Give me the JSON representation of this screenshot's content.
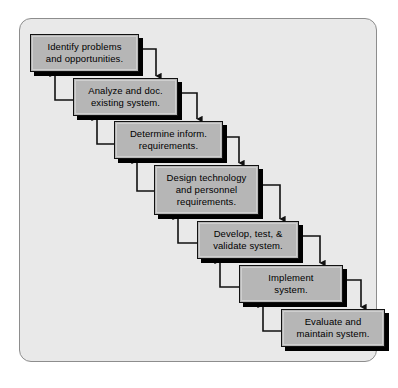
{
  "diagram": {
    "type": "waterfall-sdlc-flow",
    "frame": {
      "background_color": "#e9e9e9",
      "border_color": "#8d8d8d"
    },
    "box_style": {
      "fill_color": "#b6b6b6",
      "border_color": "#111111",
      "shadow_color": "#000000",
      "text_color": "#000000"
    },
    "stages": [
      {
        "id": "identify",
        "lines": [
          "Identify problems",
          "and opportunities."
        ],
        "x": 30,
        "y": 34,
        "width": 109,
        "height": 38
      },
      {
        "id": "analyze",
        "lines": [
          "Analyze and doc.",
          "existing system."
        ],
        "x": 73,
        "y": 78,
        "width": 105,
        "height": 38
      },
      {
        "id": "determine",
        "lines": [
          "Determine inform.",
          "requirements."
        ],
        "x": 114,
        "y": 121,
        "width": 109,
        "height": 38
      },
      {
        "id": "design",
        "lines": [
          "Design technology",
          "and personnel",
          "requirements."
        ],
        "x": 154,
        "y": 165,
        "width": 105,
        "height": 50
      },
      {
        "id": "develop",
        "lines": [
          "Develop, test, &",
          "validate system."
        ],
        "x": 197,
        "y": 221,
        "width": 102,
        "height": 38
      },
      {
        "id": "implement",
        "lines": [
          "Implement",
          "system."
        ],
        "x": 239,
        "y": 265,
        "width": 104,
        "height": 38
      },
      {
        "id": "evaluate",
        "lines": [
          "Evaluate and",
          "maintain system."
        ],
        "x": 281,
        "y": 309,
        "width": 104,
        "height": 38
      }
    ],
    "forward_arrows": [
      {
        "from": "identify",
        "to": "analyze",
        "path": "M 139 49 L 156 49 L 156 72 L 156 76",
        "label": "identify-to-analyze"
      },
      {
        "from": "analyze",
        "to": "determine",
        "path": "M 178 93 L 197 93 L 197 115 L 197 119",
        "label": "analyze-to-determine"
      },
      {
        "from": "determine",
        "to": "design",
        "path": "M 223 137 L 239 137 L 239 159 L 239 163",
        "label": "determine-to-design"
      },
      {
        "from": "design",
        "to": "develop",
        "path": "M 259 185 L 280 185 L 280 215 L 280 219",
        "label": "design-to-develop"
      },
      {
        "from": "develop",
        "to": "implement",
        "path": "M 299 236 L 320 236 L 320 259 L 320 263",
        "label": "develop-to-implement"
      },
      {
        "from": "implement",
        "to": "evaluate",
        "path": "M 343 280 L 361 280 L 361 303 L 361 307",
        "label": "implement-to-evaluate"
      }
    ],
    "feedback_arrows": [
      {
        "from": "analyze",
        "to": "identify",
        "path": "M 73 100 L 55 100 L 55 78 L 55 74",
        "label": "analyze-to-identify"
      },
      {
        "from": "determine",
        "to": "analyze",
        "path": "M 114 144 L 97 144 L 97 122 L 97 118",
        "label": "determine-to-analyze"
      },
      {
        "from": "design",
        "to": "determine",
        "path": "M 154 191 L 137 191 L 137 165 L 137 161",
        "label": "design-to-determine"
      },
      {
        "from": "develop",
        "to": "design",
        "path": "M 197 243 L 178 243 L 178 221 L 178 217",
        "label": "develop-to-design"
      },
      {
        "from": "implement",
        "to": "develop",
        "path": "M 239 287 L 220 287 L 220 265 L 220 261",
        "label": "implement-to-develop"
      },
      {
        "from": "evaluate",
        "to": "implement",
        "path": "M 281 331 L 263 331 L 263 309 L 263 305",
        "label": "evaluate-to-implement"
      }
    ]
  }
}
